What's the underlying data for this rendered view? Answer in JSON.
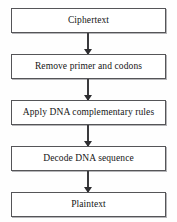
{
  "diagram": {
    "type": "flowchart",
    "orientation": "vertical",
    "background_color": "#fefefe",
    "box_border_color": "#555558",
    "arrow_color": "#2e2e31",
    "text_color": "#151515",
    "nodes": [
      {
        "id": "n1",
        "label": "Ciphertext",
        "shape": "rectangle"
      },
      {
        "id": "n2",
        "label": "Remove primer and codons",
        "shape": "rectangle"
      },
      {
        "id": "n3",
        "label": "Apply DNA complementary rules",
        "shape": "rectangle"
      },
      {
        "id": "n4",
        "label": "Decode DNA sequence",
        "shape": "rectangle"
      },
      {
        "id": "n5",
        "label": "Plaintext",
        "shape": "rectangle"
      }
    ],
    "edges": [
      {
        "id": "e1",
        "from": "n1",
        "to": "n2",
        "style": "arrow-down"
      },
      {
        "id": "e2",
        "from": "n2",
        "to": "n3",
        "style": "arrow-down"
      },
      {
        "id": "e3",
        "from": "n3",
        "to": "n4",
        "style": "arrow-down"
      },
      {
        "id": "e4",
        "from": "n4",
        "to": "n5",
        "style": "arrow-down"
      }
    ]
  }
}
